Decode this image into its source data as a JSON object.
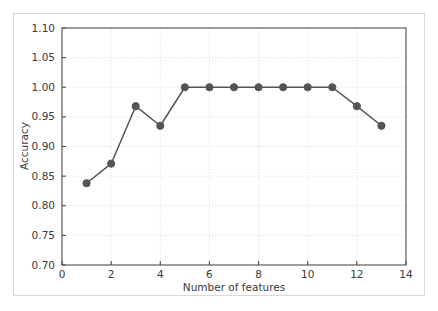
{
  "chart_data": {
    "type": "line",
    "title": "",
    "xlabel": "Number of features",
    "ylabel": "Accuracy",
    "x": [
      1,
      2,
      3,
      4,
      5,
      6,
      7,
      8,
      9,
      10,
      11,
      12,
      13
    ],
    "values": [
      0.838,
      0.871,
      0.968,
      0.935,
      1.0,
      1.0,
      1.0,
      1.0,
      1.0,
      1.0,
      1.0,
      0.968,
      0.935
    ],
    "series": [
      {
        "name": "Accuracy",
        "values": [
          0.838,
          0.871,
          0.968,
          0.935,
          1.0,
          1.0,
          1.0,
          1.0,
          1.0,
          1.0,
          1.0,
          0.968,
          0.935
        ]
      }
    ],
    "xlim": [
      0,
      14
    ],
    "ylim": [
      0.7,
      1.1
    ],
    "xticks": [
      0,
      2,
      4,
      6,
      8,
      10,
      12,
      14
    ],
    "xtick_labels": [
      "0",
      "2",
      "4",
      "6",
      "8",
      "10",
      "12",
      "14"
    ],
    "yticks": [
      0.7,
      0.75,
      0.8,
      0.85,
      0.9,
      0.95,
      1.0,
      1.05,
      1.1
    ],
    "ytick_labels": [
      "0.70",
      "0.75",
      "0.80",
      "0.85",
      "0.90",
      "0.95",
      "1.00",
      "1.05",
      "1.10"
    ],
    "grid": true,
    "legend": null,
    "legend_position": "none",
    "marker": "circle",
    "line_color": "#545454",
    "marker_color": "#545454",
    "grid_color": "#d0d0d0",
    "axis_color": "#4d4d4d",
    "background_color": "#ffffff"
  }
}
